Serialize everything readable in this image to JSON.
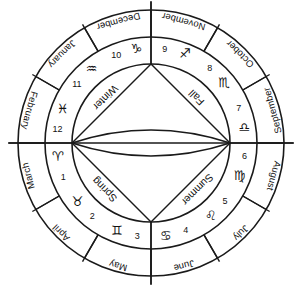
{
  "diagram": {
    "center": {
      "x": 151,
      "y": 143
    },
    "radii": {
      "outer": 133,
      "month_ring_inner": 106,
      "sign_ring_inner": 79
    },
    "colors": {
      "stroke": "#1a1a1a",
      "text": "#111111",
      "background": "#ffffff"
    },
    "axis": {
      "horizontal_label": "horizontal-diameter",
      "vertical_tick_top_label": "vertical-tick-top",
      "vertical_tick_bottom_label": "vertical-tick-bottom"
    },
    "segments": [
      {
        "month": "March",
        "house": "1",
        "sign_name": "aries",
        "glyph": "♈",
        "angle_start": 180,
        "angle_end": 210
      },
      {
        "month": "April",
        "house": "2",
        "sign_name": "taurus",
        "glyph": "♉",
        "angle_start": 210,
        "angle_end": 240
      },
      {
        "month": "May",
        "house": "3",
        "sign_name": "gemini",
        "glyph": "♊",
        "angle_start": 240,
        "angle_end": 270
      },
      {
        "month": "June",
        "house": "4",
        "sign_name": "cancer",
        "glyph": "♋",
        "angle_start": 270,
        "angle_end": 300
      },
      {
        "month": "July",
        "house": "5",
        "sign_name": "leo",
        "glyph": "♌",
        "angle_start": 300,
        "angle_end": 330
      },
      {
        "month": "August",
        "house": "6",
        "sign_name": "virgo",
        "glyph": "♍",
        "angle_start": 330,
        "angle_end": 360
      },
      {
        "month": "September",
        "house": "7",
        "sign_name": "libra",
        "glyph": "♎",
        "angle_start": 0,
        "angle_end": 30
      },
      {
        "month": "October",
        "house": "8",
        "sign_name": "scorpio",
        "glyph": "♏",
        "angle_start": 30,
        "angle_end": 60
      },
      {
        "month": "November",
        "house": "9",
        "sign_name": "sagittarius",
        "glyph": "♐",
        "angle_start": 60,
        "angle_end": 90
      },
      {
        "month": "December",
        "house": "10",
        "sign_name": "capricorn",
        "glyph": "♑",
        "angle_start": 90,
        "angle_end": 120
      },
      {
        "month": "January",
        "house": "11",
        "sign_name": "aquarius",
        "glyph": "♒",
        "angle_start": 120,
        "angle_end": 150
      },
      {
        "month": "February",
        "house": "12",
        "sign_name": "pisces",
        "glyph": "♓",
        "angle_start": 150,
        "angle_end": 180
      }
    ],
    "seasons": [
      {
        "label": "Winter",
        "quadrant": "upper-left"
      },
      {
        "label": "Fall",
        "quadrant": "upper-right"
      },
      {
        "label": "Summer",
        "quadrant": "lower-right"
      },
      {
        "label": "Spring",
        "quadrant": "lower-left"
      }
    ]
  }
}
